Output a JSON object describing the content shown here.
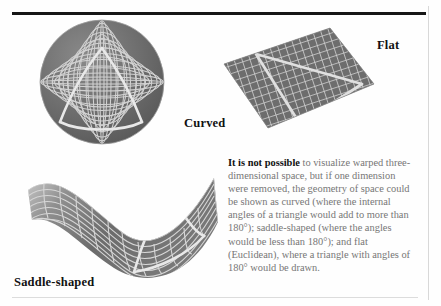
{
  "figure": {
    "labels": {
      "curved": "Curved",
      "flat": "Flat",
      "saddle": "Saddle-shaped"
    },
    "caption": {
      "lead": "It is not possible",
      "body": " to visualize warped three-dimensional space, but if one dimension were removed, the geometry of space could be shown as curved (where the internal angles of a triangle would add to more than 180°); saddle-shaped (where the angles would be less than 180°); and flat (Euclidean), where a triangle with angles of 180° would be drawn."
    },
    "colors": {
      "mesh_fill": "#6b6b6b",
      "mesh_line": "#d2d2d2",
      "triangle_line": "#e4e4e4",
      "rule_dark": "#161616",
      "rule_light": "#dcdcdc",
      "text_body": "#767676",
      "text_bold": "#111111",
      "background": "#fefefe"
    },
    "panels": [
      {
        "name": "sphere",
        "shape": "sphere",
        "label": "Curved",
        "description": "Gridded sphere with a spherical triangle whose angles sum to more than 180 degrees"
      },
      {
        "name": "plane",
        "shape": "flat-plane",
        "label": "Flat",
        "description": "Tilted gridded plane with a Euclidean triangle whose angles sum to 180 degrees"
      },
      {
        "name": "saddle",
        "shape": "saddle",
        "label": "Saddle-shaped",
        "description": "Gridded hyperbolic saddle surface with a triangle whose angles sum to less than 180 degrees"
      }
    ]
  }
}
